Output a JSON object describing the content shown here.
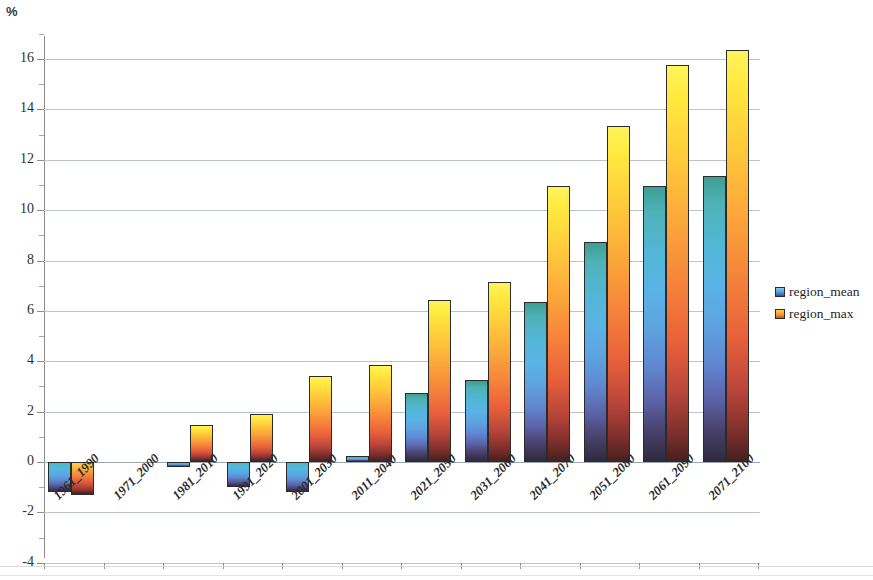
{
  "chart_data": {
    "type": "bar",
    "title": "",
    "subtitle": "",
    "xlabel": "",
    "ylabel": "%",
    "ylim": [
      -4,
      17
    ],
    "yticks": [
      -4,
      -2,
      0,
      2,
      4,
      6,
      8,
      10,
      12,
      14,
      16
    ],
    "ytick_labels": [
      "-4",
      "-2",
      "0",
      "2",
      "4",
      "6",
      "8",
      "10",
      "12",
      "14",
      "16"
    ],
    "grid": true,
    "legend_position": "right",
    "categories": [
      "1961_1990",
      "1971_2000",
      "1981_2010",
      "1991_2020",
      "2001_2030",
      "2011_2040",
      "2021_2050",
      "2031_2060",
      "2041_2070",
      "2051_2080",
      "2061_2090",
      "2071_2100"
    ],
    "series": [
      {
        "name": "region_mean",
        "color": "#4f8fd6",
        "values": [
          -1.2,
          0,
          -0.2,
          -1.0,
          -1.2,
          0.25,
          2.75,
          3.25,
          6.35,
          8.75,
          10.95,
          11.35
        ]
      },
      {
        "name": "region_max",
        "color": "#f5923a",
        "values": [
          -1.3,
          0,
          1.45,
          1.9,
          3.4,
          3.85,
          6.45,
          7.15,
          10.95,
          13.35,
          15.75,
          16.35
        ]
      }
    ]
  },
  "legend": {
    "items": [
      {
        "label": "region_mean",
        "swatch": "mean"
      },
      {
        "label": "region_max",
        "swatch": "max"
      }
    ]
  },
  "axis": {
    "unit": "%"
  }
}
